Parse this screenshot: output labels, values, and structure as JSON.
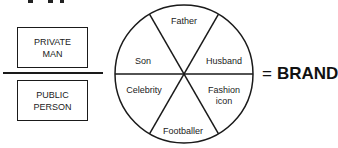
{
  "left_panel": {
    "top_box": {
      "line1": "PRIVATE",
      "line2": "MAN"
    },
    "bottom_box": {
      "line1": "PUBLIC",
      "line2": "PERSON"
    }
  },
  "wheel": {
    "segments": [
      {
        "label": "Father"
      },
      {
        "label": "Husband"
      },
      {
        "label": "Fashion",
        "label2": "icon"
      },
      {
        "label": "Footballer"
      },
      {
        "label": "Celebrity"
      },
      {
        "label": "Son"
      }
    ]
  },
  "result": {
    "equals": "=",
    "label": "BRAND"
  }
}
